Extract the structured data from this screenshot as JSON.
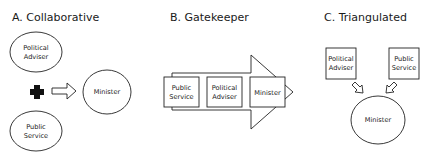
{
  "panels": {
    "a": {
      "title": "A. Collaborative",
      "political_adviser": [
        "Political",
        "Adviser"
      ],
      "public_service": [
        "Public",
        "Service"
      ],
      "minister": "Minister",
      "combine_icon": "plus-icon",
      "flow_icon": "hollow-arrow-right-icon"
    },
    "b": {
      "title": "B. Gatekeeper",
      "public_service": [
        "Public",
        "Service"
      ],
      "political_adviser": [
        "Political",
        "Adviser"
      ],
      "minister": "Minister",
      "flow_icon": "large-arrow-right-icon"
    },
    "c": {
      "title": "C. Triangulated",
      "political_adviser": [
        "Political",
        "Adviser"
      ],
      "public_service": [
        "Public",
        "Service"
      ],
      "minister": "Minister",
      "flow_icon": "hollow-arrow-down-icon"
    }
  }
}
